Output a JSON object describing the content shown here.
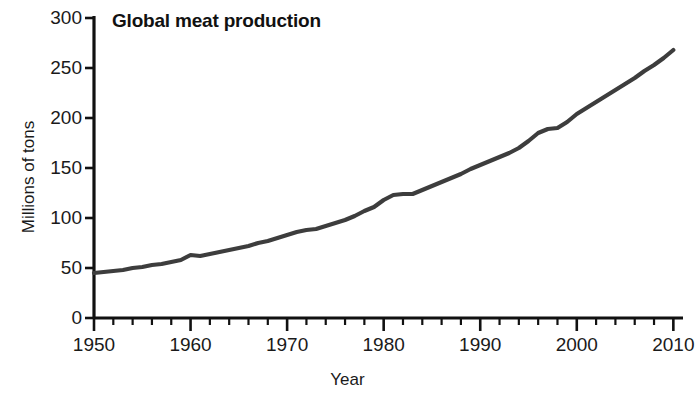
{
  "chart_data": {
    "type": "line",
    "title": "Global meat production",
    "xlabel": "Year",
    "ylabel": "Millions of tons",
    "xlim": [
      1950,
      2011
    ],
    "ylim": [
      0,
      300
    ],
    "grid": false,
    "legend": "none",
    "line_color": "#3d3d3d",
    "axis_color": "#111111",
    "x_major_ticks": [
      1950,
      1960,
      1970,
      1980,
      1990,
      2000,
      2010
    ],
    "x_major_tick_labels": [
      "1950",
      "1960",
      "1970",
      "1980",
      "1990",
      "2000",
      "2010"
    ],
    "x_minor_tick_interval": 2,
    "y_ticks": [
      0,
      50,
      100,
      150,
      200,
      250,
      300
    ],
    "y_tick_labels": [
      "0",
      "50",
      "100",
      "150",
      "200",
      "250",
      "300"
    ],
    "series": [
      {
        "name": "Global meat production",
        "x": [
          1950,
          1951,
          1952,
          1953,
          1954,
          1955,
          1956,
          1957,
          1958,
          1959,
          1960,
          1961,
          1962,
          1963,
          1964,
          1965,
          1966,
          1967,
          1968,
          1969,
          1970,
          1971,
          1972,
          1973,
          1974,
          1975,
          1976,
          1977,
          1978,
          1979,
          1980,
          1981,
          1982,
          1983,
          1984,
          1985,
          1986,
          1987,
          1988,
          1989,
          1990,
          1991,
          1992,
          1993,
          1994,
          1995,
          1996,
          1997,
          1998,
          1999,
          2000,
          2001,
          2002,
          2003,
          2004,
          2005,
          2006,
          2007,
          2008,
          2009,
          2010
        ],
        "values": [
          45,
          46,
          47,
          48,
          50,
          51,
          53,
          54,
          56,
          58,
          63,
          62,
          64,
          66,
          68,
          70,
          72,
          75,
          77,
          80,
          83,
          86,
          88,
          89,
          92,
          95,
          98,
          102,
          107,
          111,
          118,
          123,
          124,
          124,
          128,
          132,
          136,
          140,
          144,
          149,
          153,
          157,
          161,
          165,
          170,
          177,
          185,
          189,
          190,
          196,
          204,
          210,
          216,
          222,
          228,
          234,
          240,
          247,
          253,
          260,
          268
        ]
      }
    ]
  },
  "axes": {
    "y_label": "Millions of tons",
    "x_label": "Year"
  }
}
